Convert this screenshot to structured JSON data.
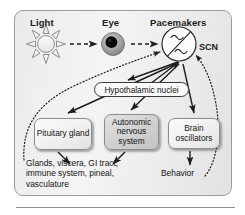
{
  "figure": {
    "panel": {
      "border_color": "#9a9a9a",
      "background": "#efefef"
    }
  },
  "headers": [
    {
      "id": "light",
      "label": "Light"
    },
    {
      "id": "eye",
      "label": "Eye"
    },
    {
      "id": "pacemakers",
      "label": "Pacemakers"
    }
  ],
  "icons": {
    "sun": "sun-icon",
    "eye": "eye-icon",
    "oscillator": "oscillator-icon"
  },
  "labels": {
    "scn": "SCN",
    "hypothalamic_nuclei": "Hypothalamic nuclei",
    "behavior": "Behavior",
    "targets": "Glands, viscera, GI tract,\nimmune system, pineal,\nvasculature"
  },
  "nodes": [
    {
      "id": "pituitary",
      "label": "Pituitary\ngland",
      "style": "light"
    },
    {
      "id": "ans",
      "label": "Autonomic\nnervous\nsystem",
      "style": "dark"
    },
    {
      "id": "brain_osc",
      "label": "Brain\noscillators",
      "style": "light"
    }
  ],
  "colors": {
    "text": "#141414",
    "stroke": "#1d1d1d",
    "panel_border": "#9a9a9a",
    "node_border": "#8c8c8c",
    "node_light": "#f2f2f2",
    "node_dark": "#d3d3d3",
    "eye_iris": "#9e9e9e",
    "eye_pupil": "#0a0a0a",
    "sun_fill": "#efefef"
  },
  "connections": [
    {
      "from": "light",
      "to": "eye",
      "style": "dashed",
      "arrow": true
    },
    {
      "from": "eye",
      "to": "scn",
      "style": "dashed",
      "arrow": true
    },
    {
      "from": "targets",
      "to": "scn",
      "style": "dotted",
      "arrow": true
    },
    {
      "from": "behavior",
      "to": "scn",
      "style": "dotted",
      "arrow": true
    },
    {
      "from": "scn",
      "to": "hypothalamic_nuclei",
      "style": "solid",
      "arrow": "double"
    },
    {
      "from": "scn",
      "to": "pituitary",
      "style": "solid",
      "arrow": true
    },
    {
      "from": "scn",
      "to": "ans",
      "style": "solid",
      "arrow": true
    },
    {
      "from": "scn",
      "to": "brain_osc",
      "style": "solid",
      "arrow": true
    },
    {
      "from": "pituitary",
      "to": "targets",
      "style": "solid",
      "arrow": true
    },
    {
      "from": "ans",
      "to": "targets",
      "style": "solid",
      "arrow": true
    },
    {
      "from": "brain_osc",
      "to": "behavior",
      "style": "solid",
      "arrow": true
    }
  ]
}
